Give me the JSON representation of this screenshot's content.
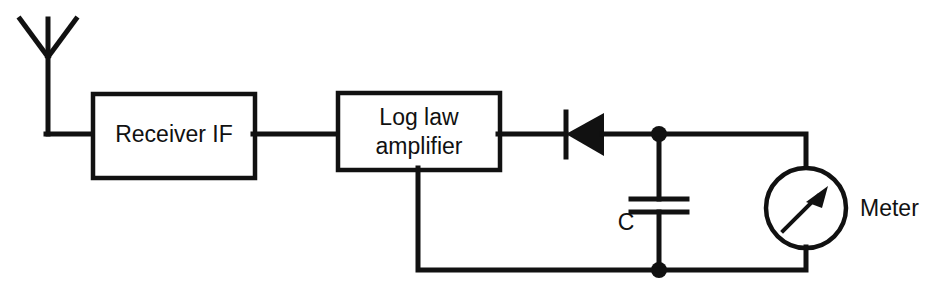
{
  "diagram": {
    "background_color": "#ffffff",
    "line_color": "#111111",
    "width": 937,
    "height": 297
  },
  "blocks": [
    {
      "id": "receiver-if",
      "label": "Receiver IF",
      "lines": [
        "Receiver IF"
      ]
    },
    {
      "id": "log-law-amplifier",
      "label": "Log law amplifier",
      "lines": [
        "Log law",
        "amplifier"
      ]
    }
  ],
  "components": [
    {
      "id": "antenna",
      "name": "antenna-symbol",
      "label": ""
    },
    {
      "id": "diode",
      "name": "diode-symbol",
      "label": "",
      "orientation": "cathode-left"
    },
    {
      "id": "capacitor",
      "name": "capacitor-symbol",
      "label": "C"
    },
    {
      "id": "meter",
      "name": "meter-symbol",
      "label": "Meter"
    }
  ],
  "labels": {
    "receiver_line1": "Receiver IF",
    "amplifier_line1": "Log law",
    "amplifier_line2": "amplifier",
    "capacitor": "C",
    "meter": "Meter"
  }
}
